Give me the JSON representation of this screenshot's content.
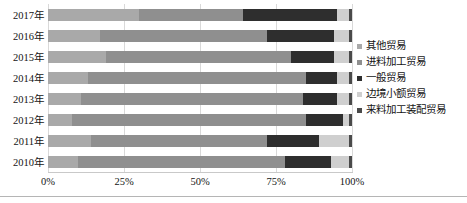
{
  "chart_data": {
    "type": "bar",
    "orientation": "horizontal",
    "stacked": "percent",
    "title": "",
    "subtitle": "",
    "xlabel": "",
    "ylabel": "",
    "xlim": [
      0,
      100
    ],
    "grid": true,
    "legend_position": "right",
    "xticks": [
      "0%",
      "25%",
      "50%",
      "75%",
      "100%"
    ],
    "xtick_values": [
      0,
      25,
      50,
      75,
      100
    ],
    "categories": [
      "2017年",
      "2016年",
      "2015年",
      "2014年",
      "2013年",
      "2012年",
      "2011年",
      "2010年"
    ],
    "series": [
      {
        "name": "其他贸易",
        "color": "#a9a9a9",
        "values": [
          30.0,
          17.0,
          19.0,
          13.0,
          11.0,
          8.0,
          14.0,
          10.0
        ]
      },
      {
        "name": "进料加工贸易",
        "color": "#8f8f8f",
        "values": [
          34.0,
          55.0,
          61.0,
          72.0,
          73.0,
          77.0,
          58.0,
          68.0
        ]
      },
      {
        "name": "一般贸易",
        "color": "#2e2e2e",
        "values": [
          31.0,
          22.0,
          14.0,
          10.0,
          11.0,
          12.0,
          17.0,
          15.0
        ]
      },
      {
        "name": "边境小额贸易",
        "color": "#cfcfcf",
        "values": [
          4.0,
          5.0,
          5.0,
          4.0,
          4.0,
          2.0,
          10.0,
          6.0
        ]
      },
      {
        "name": "来料加工装配贸易",
        "color": "#4a4a4a",
        "values": [
          1.0,
          1.0,
          1.0,
          1.0,
          1.0,
          1.0,
          1.0,
          1.0
        ]
      }
    ]
  },
  "legend": {
    "items": [
      {
        "label": "其他贸易",
        "swatch": "#a9a9a9"
      },
      {
        "label": "进料加工贸易",
        "swatch": "#8f8f8f"
      },
      {
        "label": "一般贸易",
        "swatch": "#2e2e2e"
      },
      {
        "label": "边境小额贸易",
        "swatch": "#cfcfcf"
      },
      {
        "label": "来料加工装配贸易",
        "swatch": "#4a4a4a"
      }
    ]
  },
  "axis": {
    "x_ticks": [
      {
        "label": "0%",
        "value": 0
      },
      {
        "label": "25%",
        "value": 25
      },
      {
        "label": "50%",
        "value": 50
      },
      {
        "label": "75%",
        "value": 75
      },
      {
        "label": "100%",
        "value": 100
      }
    ]
  }
}
